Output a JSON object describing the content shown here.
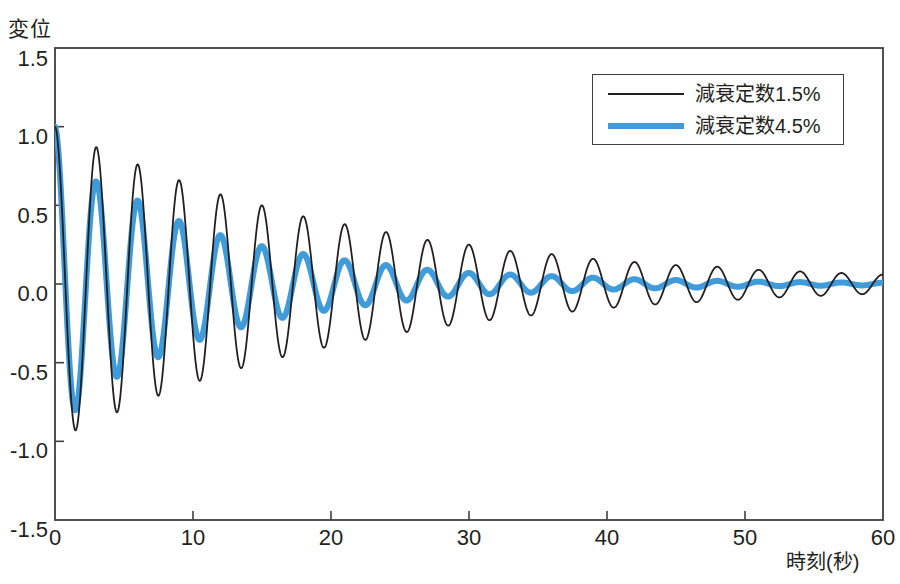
{
  "chart_data": {
    "type": "line",
    "title": "",
    "xlabel": "時刻(秒)",
    "ylabel": "変位",
    "xlim": [
      0,
      60
    ],
    "ylim": [
      -1.5,
      1.5
    ],
    "xticks": [
      0,
      10,
      20,
      30,
      40,
      50,
      60
    ],
    "xtick_labels": [
      "0",
      "10",
      "20",
      "30",
      "40",
      "50",
      "60"
    ],
    "yticks": [
      1.5,
      1.0,
      0.5,
      0.0,
      -0.5,
      -1.0,
      -1.5
    ],
    "ytick_labels": [
      "1.5",
      "1.0",
      "0.5",
      "0.0",
      "-0.5",
      "-1.0",
      "-1.5"
    ],
    "grid": false,
    "legend_position": "upper right",
    "period_seconds": 3.0,
    "initial_displacement": 1.0,
    "series": [
      {
        "name": "減衰定数1.5%",
        "color": "#231f20",
        "line_width": 1.8,
        "damping_ratio": 0.015,
        "envelope_samples": [
          {
            "t": 0,
            "amplitude": 1.0
          },
          {
            "t": 1.5,
            "amplitude": 0.93
          },
          {
            "t": 3,
            "amplitude": 0.87
          },
          {
            "t": 6,
            "amplitude": 0.76
          },
          {
            "t": 9,
            "amplitude": 0.66
          },
          {
            "t": 12,
            "amplitude": 0.57
          },
          {
            "t": 15,
            "amplitude": 0.5
          },
          {
            "t": 18,
            "amplitude": 0.43
          },
          {
            "t": 21,
            "amplitude": 0.38
          },
          {
            "t": 24,
            "amplitude": 0.33
          },
          {
            "t": 27,
            "amplitude": 0.28
          },
          {
            "t": 30,
            "amplitude": 0.25
          },
          {
            "t": 33,
            "amplitude": 0.21
          },
          {
            "t": 36,
            "amplitude": 0.19
          },
          {
            "t": 39,
            "amplitude": 0.16
          },
          {
            "t": 42,
            "amplitude": 0.14
          },
          {
            "t": 45,
            "amplitude": 0.12
          },
          {
            "t": 48,
            "amplitude": 0.11
          },
          {
            "t": 51,
            "amplitude": 0.09
          },
          {
            "t": 54,
            "amplitude": 0.08
          },
          {
            "t": 57,
            "amplitude": 0.07
          },
          {
            "t": 60,
            "amplitude": 0.06
          }
        ]
      },
      {
        "name": "減衰定数4.5%",
        "color": "#3f9bd9",
        "line_width": 6.0,
        "damping_ratio": 0.045,
        "envelope_samples": [
          {
            "t": 0,
            "amplitude": 1.0
          },
          {
            "t": 1.5,
            "amplitude": 0.8
          },
          {
            "t": 3,
            "amplitude": 0.65
          },
          {
            "t": 6,
            "amplitude": 0.53
          },
          {
            "t": 9,
            "amplitude": 0.4
          },
          {
            "t": 12,
            "amplitude": 0.31
          },
          {
            "t": 15,
            "amplitude": 0.24
          },
          {
            "t": 18,
            "amplitude": 0.19
          },
          {
            "t": 21,
            "amplitude": 0.15
          },
          {
            "t": 24,
            "amplitude": 0.12
          },
          {
            "t": 27,
            "amplitude": 0.09
          },
          {
            "t": 30,
            "amplitude": 0.07
          },
          {
            "t": 33,
            "amplitude": 0.06
          },
          {
            "t": 36,
            "amplitude": 0.05
          },
          {
            "t": 39,
            "amplitude": 0.04
          },
          {
            "t": 42,
            "amplitude": 0.03
          },
          {
            "t": 45,
            "amplitude": 0.025
          },
          {
            "t": 48,
            "amplitude": 0.02
          },
          {
            "t": 51,
            "amplitude": 0.015
          },
          {
            "t": 54,
            "amplitude": 0.012
          },
          {
            "t": 57,
            "amplitude": 0.01
          },
          {
            "t": 60,
            "amplitude": 0.008
          }
        ]
      }
    ]
  },
  "axes": {
    "frame_color": "#3f3f3f",
    "background": "#ffffff"
  },
  "legend": {
    "entries": [
      {
        "label": "減衰定数1.5%",
        "color": "#231f20"
      },
      {
        "label": "減衰定数4.5%",
        "color": "#3f9bd9"
      }
    ]
  }
}
